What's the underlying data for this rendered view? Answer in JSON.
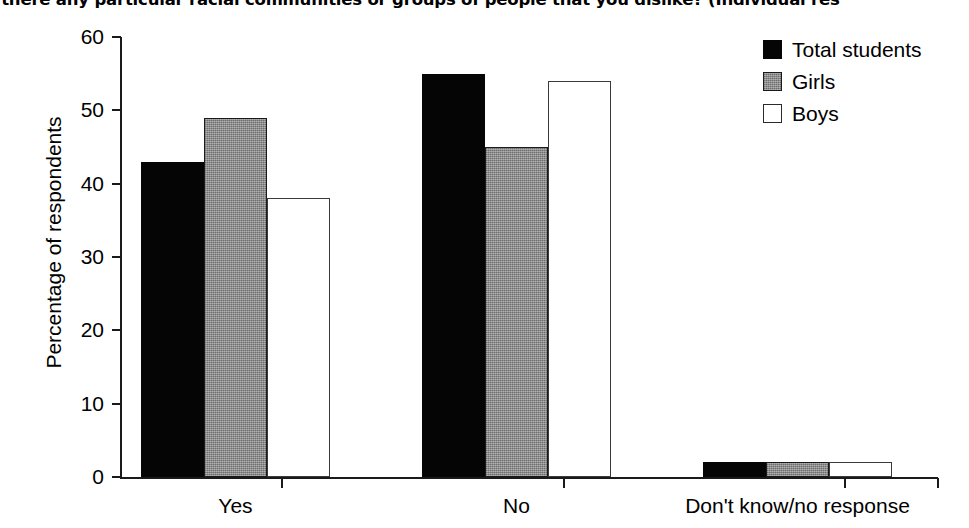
{
  "chart_data": {
    "type": "bar",
    "title": "s there any particular racial communities or groups of people that you dislike? (Individual res",
    "xlabel": "",
    "ylabel": "Percentage of respondents",
    "categories": [
      "Yes",
      "No",
      "Don't know/no response"
    ],
    "ylim": [
      0,
      60
    ],
    "yticks": [
      0,
      10,
      20,
      30,
      40,
      50,
      60
    ],
    "ytick_labels": [
      "0",
      "10",
      "20",
      "30",
      "40",
      "50",
      "60"
    ],
    "grid": false,
    "legend_position": "top-right",
    "series": [
      {
        "name": "Total students",
        "color": "#050505",
        "fill": "solid",
        "values": [
          43,
          55,
          2
        ]
      },
      {
        "name": "Girls",
        "color": "#8c8c8c",
        "fill": "hatched",
        "values": [
          49,
          45,
          2
        ]
      },
      {
        "name": "Boys",
        "color": "#ffffff",
        "fill": "open",
        "values": [
          38,
          54,
          2
        ]
      }
    ]
  },
  "legend": {
    "items": [
      {
        "label": "Total students",
        "swatch": "total"
      },
      {
        "label": "Girls",
        "swatch": "girls"
      },
      {
        "label": "Boys",
        "swatch": "boys"
      }
    ]
  }
}
